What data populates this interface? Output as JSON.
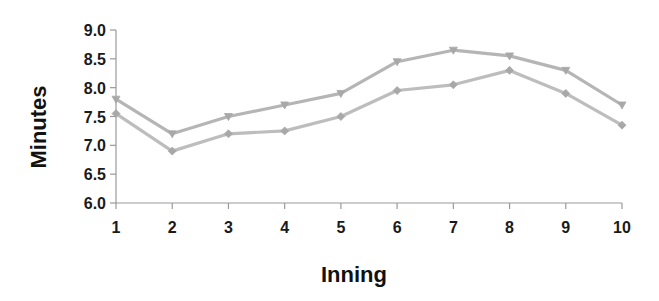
{
  "chart_data": {
    "type": "line",
    "title": "",
    "xlabel": "Inning",
    "ylabel": "Minutes",
    "categories": [
      "1",
      "2",
      "3",
      "4",
      "5",
      "6",
      "7",
      "8",
      "9",
      "10"
    ],
    "x": [
      1,
      2,
      3,
      4,
      5,
      6,
      7,
      8,
      9,
      10
    ],
    "series": [
      {
        "name": "Series 1 (upper)",
        "marker": "triangle-down",
        "color": "#b5b5b5",
        "values": [
          7.8,
          7.2,
          7.5,
          7.7,
          7.9,
          8.45,
          8.65,
          8.55,
          8.3,
          7.7
        ]
      },
      {
        "name": "Series 2 (lower)",
        "marker": "diamond",
        "color": "#bdbdbd",
        "values": [
          7.55,
          6.9,
          7.2,
          7.25,
          7.5,
          7.95,
          8.05,
          8.3,
          7.9,
          7.35
        ]
      }
    ],
    "ylim": [
      6.0,
      9.0
    ],
    "yticks": [
      "6.0",
      "6.5",
      "7.0",
      "7.5",
      "8.0",
      "8.5",
      "9.0"
    ],
    "grid": false,
    "legend": "none"
  },
  "axes": {
    "x_title": "Inning",
    "y_title": "Minutes"
  }
}
